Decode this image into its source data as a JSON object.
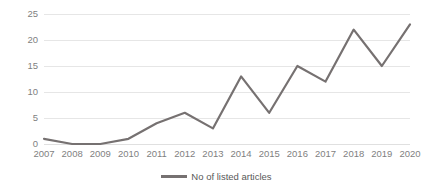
{
  "chart_data": {
    "type": "line",
    "title": "",
    "xlabel": "",
    "ylabel": "",
    "categories": [
      "2007",
      "2008",
      "2009",
      "2010",
      "2011",
      "2012",
      "2013",
      "2014",
      "2015",
      "2016",
      "2017",
      "2018",
      "2019",
      "2020"
    ],
    "series": [
      {
        "name": "No of listed articles",
        "values": [
          1,
          0,
          0,
          1,
          4,
          6,
          3,
          13,
          6,
          15,
          12,
          22,
          15,
          23
        ],
        "color": "#767171"
      }
    ],
    "ylim": [
      0,
      25
    ],
    "ytick_values": [
      0,
      5,
      10,
      15,
      20,
      25
    ],
    "ytick_labels": [
      "0",
      "5",
      "10",
      "15",
      "20",
      "25"
    ],
    "grid": "horizontal",
    "legend_position": "bottom-center"
  },
  "legend": {
    "entries": [
      {
        "label": "No of listed articles",
        "marker": "line-marker",
        "color": "#767171"
      }
    ]
  },
  "colors": {
    "line": "#767171",
    "gridline": "#e6e6e6",
    "axis_text": "#7f7f7f",
    "legend_text": "#595959",
    "background": "#ffffff"
  }
}
